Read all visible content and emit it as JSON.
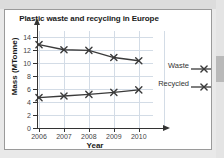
{
  "card": {
    "border_color": "#9a9a9a",
    "background": "#ffffff"
  },
  "page": {
    "background": "#e9e9e9"
  },
  "chart_data": {
    "type": "line",
    "title": "Plastic waste and recycling in Europe",
    "xlabel": "Year",
    "ylabel": "Mass (MTonne)",
    "categories": [
      "2006",
      "2007",
      "2008",
      "2009",
      "2010"
    ],
    "ylim": [
      0,
      15
    ],
    "yticks": [
      0,
      2,
      4,
      6,
      8,
      10,
      12,
      14
    ],
    "ytick_labels": [
      "0",
      "2",
      "4",
      "6",
      "8",
      "10",
      "12",
      "14"
    ],
    "grid": true,
    "legend_position": "right",
    "marker": "x",
    "line_color": "#3a3a3a",
    "grid_color": "#d3dce6",
    "series": [
      {
        "name": "Waste",
        "values": [
          12.9,
          12.1,
          12.0,
          10.9,
          10.4
        ]
      },
      {
        "name": "Recycled",
        "values": [
          4.7,
          4.95,
          5.2,
          5.5,
          5.9
        ]
      }
    ]
  }
}
